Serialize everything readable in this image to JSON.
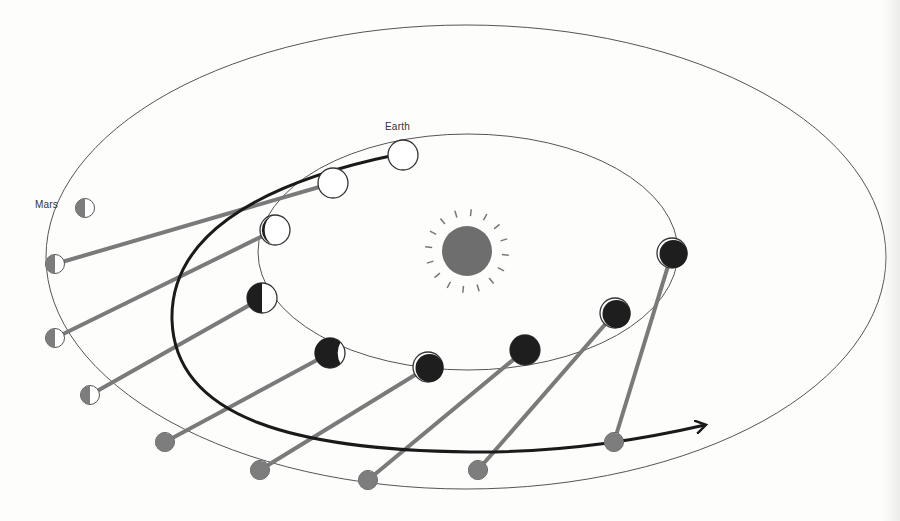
{
  "labels": {
    "earth": "Earth",
    "mars": "Mars"
  },
  "colors": {
    "background": "#fdfdfc",
    "orbit_line": "#555555",
    "sight_line": "#7a7a7a",
    "mars_fill": "#7d7d7d",
    "earth_dark": "#1e1e1e",
    "sun": "#6e6e6e",
    "apparent_path": "#1a1a1a"
  },
  "sun": {
    "cx": 467,
    "cy": 251,
    "r": 25
  },
  "orbits": {
    "earth": {
      "cx": 468,
      "cy": 252,
      "rx": 210,
      "ry": 118
    },
    "mars": {
      "cx": 466,
      "cy": 257,
      "rx": 420,
      "ry": 232
    }
  },
  "earth_positions": [
    {
      "x": 403,
      "y": 155,
      "phase": "full"
    },
    {
      "x": 333,
      "y": 183,
      "phase": "full"
    },
    {
      "x": 275,
      "y": 230,
      "phase": "crescent-left"
    },
    {
      "x": 262,
      "y": 298,
      "phase": "half-left"
    },
    {
      "x": 330,
      "y": 353,
      "phase": "gibbous-dark"
    },
    {
      "x": 428,
      "y": 367,
      "phase": "mostly-dark"
    },
    {
      "x": 525,
      "y": 350,
      "phase": "dark"
    },
    {
      "x": 615,
      "y": 313,
      "phase": "mostly-dark"
    },
    {
      "x": 672,
      "y": 253,
      "phase": "mostly-dark"
    }
  ],
  "mars_positions": [
    {
      "x": 85,
      "y": 208
    },
    {
      "x": 55,
      "y": 264
    },
    {
      "x": 55,
      "y": 338
    },
    {
      "x": 90,
      "y": 395
    },
    {
      "x": 165,
      "y": 442
    },
    {
      "x": 260,
      "y": 470
    },
    {
      "x": 368,
      "y": 480
    },
    {
      "x": 478,
      "y": 470
    },
    {
      "x": 614,
      "y": 442
    }
  ],
  "sight_lines": [
    [
      1,
      1
    ],
    [
      2,
      2
    ],
    [
      3,
      3
    ],
    [
      4,
      4
    ],
    [
      5,
      5
    ],
    [
      6,
      6
    ],
    [
      7,
      7
    ],
    [
      8,
      8
    ]
  ],
  "apparent_path": {
    "d": "M 395 155 C 250 185, 170 240, 172 320 C 175 420, 300 450, 470 452 C 560 453, 640 440, 705 425",
    "arrow_tip": {
      "x": 708,
      "y": 425
    }
  }
}
